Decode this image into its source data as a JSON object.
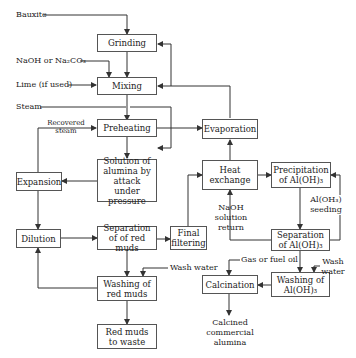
{
  "diagram": {
    "inputs": {
      "bauxite": "Bauxite",
      "naoh": "NaOH or Na₂CO₃",
      "lime": "Lime (if used)",
      "steam": "Steam",
      "recovered_steam": "Recovered steam",
      "naoh_return": "NaOH solution return",
      "seeding": "Al(OH₃) seeding",
      "wash_water_1": "Wash water",
      "wash_water_2": "Wash water",
      "gas_fuel": "Gas or fuel oil",
      "product": "Calcined commercial alumina"
    },
    "boxes": {
      "grinding": "Grinding",
      "mixing": "Mixing",
      "preheating": "Preheating",
      "solution": "Solution of alumina by attack under pressure",
      "expansion": "Expansion",
      "dilution": "Dilution",
      "separation_red": "Separation of of red muds",
      "final_filtering": "Final filtering",
      "washing_red": "Washing of red muds",
      "red_waste": "Red muds to waste",
      "evaporation": "Evaporation",
      "heat_exchange": "Heat exchange",
      "precipitation": "Precipitation of Al(OH)₃",
      "separation_aloh": "Separation of Al(OH)₃",
      "washing_aloh": "Washing of Al(OH)₃",
      "calcination": "Calcination"
    }
  }
}
